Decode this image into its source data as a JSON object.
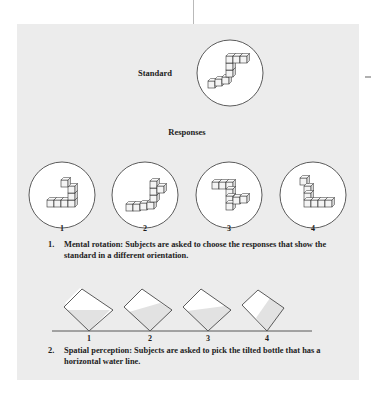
{
  "figure": {
    "standard_label": "Standard",
    "responses_label": "Responses",
    "rotation_items": [
      {
        "number": "1"
      },
      {
        "number": "2"
      },
      {
        "number": "3"
      },
      {
        "number": "4"
      }
    ],
    "caption_1": {
      "number": "1.",
      "text": "Mental rotation: Subjects are asked to choose the responses that show the standard in a different orientation."
    },
    "bottle_items": [
      {
        "number": "1"
      },
      {
        "number": "2"
      },
      {
        "number": "3"
      },
      {
        "number": "4"
      }
    ],
    "caption_2": {
      "number": "2.",
      "text": "Spatial perception: Subjects are asked to pick the tilted bottle that has a horizontal water line."
    }
  },
  "colors": {
    "panel": "#ececec",
    "outline": "#333333",
    "water": "#e2e2e2",
    "air": "#ffffff"
  }
}
